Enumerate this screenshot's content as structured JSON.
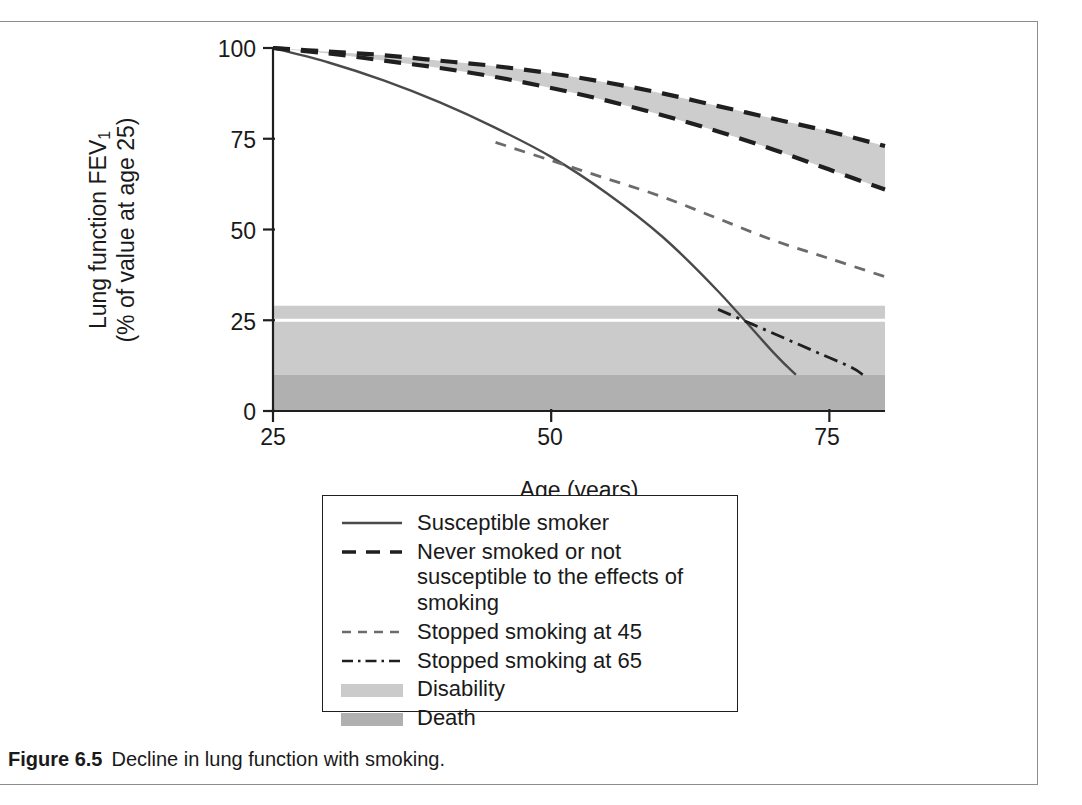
{
  "figure": {
    "caption_label": "Figure 6.5",
    "caption_text": "Decline in lung function with smoking."
  },
  "axes": {
    "x_title": "Age (years)",
    "y_title_line1": "Lung function FEV",
    "y_title_sub": "1",
    "y_title_line2": "(% of value at age 25)",
    "x_ticks": [
      "25",
      "50",
      "75"
    ],
    "y_ticks": [
      "0",
      "25",
      "50",
      "75",
      "100"
    ]
  },
  "legend": {
    "items": [
      {
        "label": "Susceptible smoker",
        "style": "solid"
      },
      {
        "label": "Never smoked or not susceptible to the effects of smoking",
        "style": "long-dash"
      },
      {
        "label": "Stopped smoking at 45",
        "style": "short-dash"
      },
      {
        "label": "Stopped smoking at 65",
        "style": "dash-dot"
      },
      {
        "label": "Disability",
        "style": "band-light"
      },
      {
        "label": "Death",
        "style": "band-dark"
      }
    ]
  },
  "colors": {
    "line": "#3c3c3c",
    "line_dark": "#1f1f1f",
    "disability_band": "#cbcbcb",
    "death_band": "#b0b0b0",
    "never_smoked_band": "#cdcdcd",
    "frame": "#8d8d8d",
    "text": "#1a1a1a"
  },
  "chart_data": {
    "type": "line",
    "title": "Decline in lung function with smoking",
    "xlabel": "Age (years)",
    "ylabel": "Lung function FEV1 (% of value at age 25)",
    "xlim": [
      25,
      80
    ],
    "ylim": [
      0,
      100
    ],
    "xticks": [
      25,
      50,
      75
    ],
    "yticks": [
      0,
      25,
      50,
      75,
      100
    ],
    "grid": false,
    "legend_position": "below-plot",
    "shaded_bands": [
      {
        "name": "Disability",
        "y_from": 10,
        "y_to": 29,
        "color": "#cbcbcb"
      },
      {
        "name": "Death",
        "y_from": 0,
        "y_to": 10,
        "color": "#b0b0b0"
      }
    ],
    "series": [
      {
        "name": "Susceptible smoker",
        "style": "solid",
        "x": [
          25,
          30,
          35,
          40,
          45,
          50,
          55,
          60,
          65,
          70,
          72
        ],
        "values": [
          100,
          96,
          91,
          85,
          78,
          70,
          60,
          48,
          33,
          16,
          10
        ]
      },
      {
        "name": "Never smoked or not susceptible to the effects of smoking",
        "style": "long-dash",
        "note": "plotted as an upper and lower bound with grey fill between",
        "x": [
          25,
          30,
          35,
          40,
          45,
          50,
          55,
          60,
          65,
          70,
          75,
          80
        ],
        "upper": [
          100,
          99,
          98,
          96.5,
          95,
          93,
          90.5,
          87.5,
          84,
          80.5,
          77,
          73
        ],
        "lower": [
          100,
          98.5,
          96.5,
          94.5,
          92,
          89,
          85.5,
          81.5,
          77,
          72,
          66.5,
          61
        ]
      },
      {
        "name": "Stopped smoking at 45",
        "style": "short-dash",
        "x": [
          45,
          50,
          55,
          60,
          65,
          70,
          75,
          80
        ],
        "values": [
          74,
          69,
          64,
          59,
          53,
          47,
          42,
          37
        ]
      },
      {
        "name": "Stopped smoking at 65",
        "style": "dash-dot",
        "x": [
          65,
          68,
          71,
          74,
          77,
          78
        ],
        "values": [
          28,
          24,
          20,
          16,
          12,
          10
        ]
      }
    ]
  }
}
